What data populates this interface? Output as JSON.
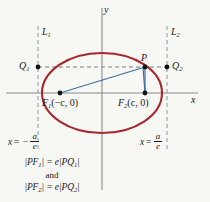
{
  "figure": {
    "background_color": "#f7f7f4",
    "axes": {
      "x_label": "x",
      "y_label": "y",
      "axis_color": "#8a8a8a",
      "origin": [
        102,
        93
      ]
    },
    "curve": {
      "name": "ellipse",
      "color": "#a8272f",
      "center": [
        102,
        93
      ],
      "semi_major_x": 60,
      "semi_minor_y": 40
    },
    "segments_color": "#3a6ea5",
    "dashed_color": "#8a9aa8",
    "points": {
      "focus_left": {
        "label_main": "F",
        "label_sub": "1",
        "label_coords": "(−c, 0)",
        "x": 60,
        "y": 93
      },
      "focus_right": {
        "label_main": "F",
        "label_sub": "2",
        "label_coords": "(c, 0)",
        "x": 145,
        "y": 93
      },
      "p": {
        "label": "P",
        "x": 145,
        "y": 67
      },
      "q_left": {
        "label_main": "Q",
        "label_sub": "1",
        "x": 38,
        "y": 67
      },
      "q_right": {
        "label_main": "Q",
        "label_sub": "2",
        "x": 167,
        "y": 67
      }
    },
    "directrices": {
      "left": {
        "label_main": "L",
        "label_sub": "1",
        "x": 38,
        "equation": {
          "lhs": "x",
          "op": "= −",
          "numerator": "a",
          "denominator": "e"
        }
      },
      "right": {
        "label_main": "L",
        "label_sub": "2",
        "x": 167,
        "equation": {
          "lhs": "x",
          "op": "=",
          "numerator": "a",
          "denominator": "e"
        }
      }
    },
    "relations": {
      "first": {
        "lhs_open": "|PF",
        "lhs_sub": "1",
        "mid": "| = e|PQ",
        "rhs_sub": "1",
        "close": "|"
      },
      "conjunction": "and",
      "second": {
        "lhs_open": "|PF",
        "lhs_sub": "2",
        "mid": "| = e|PQ",
        "rhs_sub": "2",
        "close": "|"
      }
    }
  }
}
